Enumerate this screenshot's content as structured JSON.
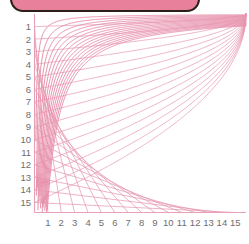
{
  "banner": {
    "label": "",
    "fill_color": "#e87f9b",
    "border_color": "#2b2018"
  },
  "colors": {
    "curve": "#e2789a",
    "curve_secondary": "#e695ae",
    "axis": "#e8a0b4",
    "tick_text": "#6e6e70",
    "background": "#ffffff"
  },
  "chart_data": {
    "type": "line",
    "title": "",
    "xlabel": "",
    "ylabel": "",
    "xlim": [
      0,
      15.8
    ],
    "ylim": [
      0,
      15.8
    ],
    "grid": false,
    "legend": null,
    "x_ticks": [
      1,
      2,
      3,
      4,
      5,
      6,
      7,
      8,
      9,
      10,
      11,
      12,
      13,
      14,
      15
    ],
    "y_ticks": [
      1,
      2,
      3,
      4,
      5,
      6,
      7,
      8,
      9,
      10,
      11,
      12,
      13,
      14,
      15
    ],
    "y_axis_inverted": true,
    "series": [
      {
        "name": "xy = 1",
        "k": 1,
        "family": "a"
      },
      {
        "name": "xy = 2",
        "k": 2,
        "family": "a"
      },
      {
        "name": "xy = 3",
        "k": 3,
        "family": "a"
      },
      {
        "name": "xy = 4",
        "k": 4,
        "family": "a"
      },
      {
        "name": "xy = 5",
        "k": 5,
        "family": "a"
      },
      {
        "name": "xy = 6",
        "k": 6,
        "family": "a"
      },
      {
        "name": "xy = 7",
        "k": 7,
        "family": "a"
      },
      {
        "name": "xy = 8",
        "k": 8,
        "family": "a"
      },
      {
        "name": "xy = 9",
        "k": 9,
        "family": "a"
      },
      {
        "name": "xy = 10",
        "k": 10,
        "family": "a"
      },
      {
        "name": "xy = 11",
        "k": 11,
        "family": "a"
      },
      {
        "name": "xy = 12",
        "k": 12,
        "family": "a"
      },
      {
        "name": "xy = 13",
        "k": 13,
        "family": "a"
      },
      {
        "name": "xy = 14",
        "k": 14,
        "family": "a"
      },
      {
        "name": "xy = 15",
        "k": 15,
        "family": "a"
      }
    ],
    "secant_lines": [
      {
        "name": "chord 1",
        "index": 1
      },
      {
        "name": "chord 2",
        "index": 2
      },
      {
        "name": "chord 3",
        "index": 3
      },
      {
        "name": "chord 4",
        "index": 4
      },
      {
        "name": "chord 5",
        "index": 5
      },
      {
        "name": "chord 6",
        "index": 6
      },
      {
        "name": "chord 7",
        "index": 7
      },
      {
        "name": "chord 8",
        "index": 8
      },
      {
        "name": "chord 9",
        "index": 9
      },
      {
        "name": "chord 10",
        "index": 10
      },
      {
        "name": "chord 11",
        "index": 11
      },
      {
        "name": "chord 12",
        "index": 12
      },
      {
        "name": "chord 13",
        "index": 13
      },
      {
        "name": "chord 14",
        "index": 14
      },
      {
        "name": "chord 15",
        "index": 15
      }
    ]
  }
}
